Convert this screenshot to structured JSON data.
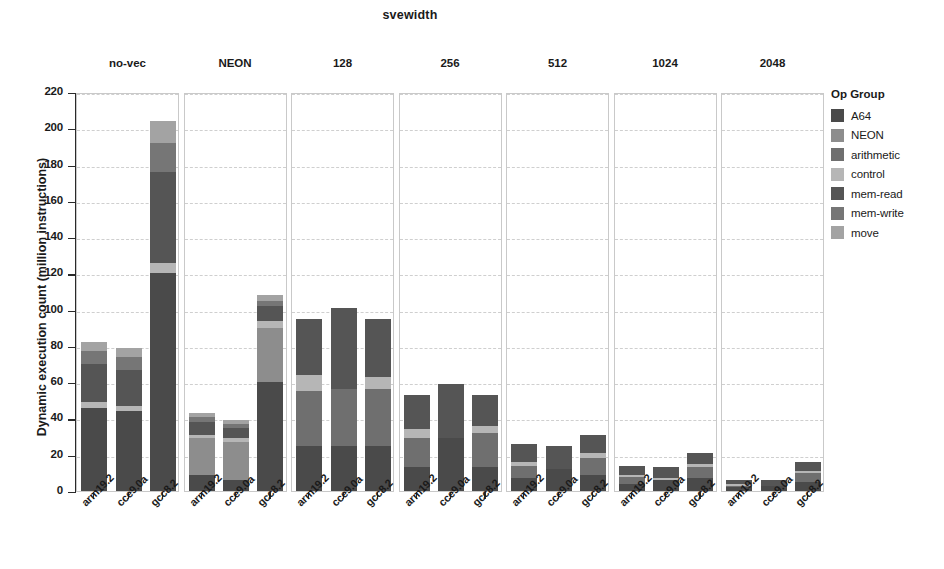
{
  "chart_data": {
    "type": "bar",
    "subtype": "stacked-bar-faceted",
    "title": "svewidth",
    "xlabel": "",
    "ylabel": "Dynamic execution count (million instructions)",
    "ylim": [
      0,
      220
    ],
    "ytick_step": 20,
    "yticks": [
      "220",
      "200",
      "180",
      "160",
      "140",
      "120",
      "100",
      "80",
      "60",
      "40",
      "20",
      "0"
    ],
    "grid": true,
    "legend_position": "right",
    "legend_title": "Op Group",
    "categories": [
      "arm19.2",
      "cce9.0a",
      "gcc8.2"
    ],
    "facets": [
      "no-vec",
      "NEON",
      "128",
      "256",
      "512",
      "1024",
      "2048"
    ],
    "series": [
      {
        "name": "A64",
        "color": "#4a4a4a"
      },
      {
        "name": "NEON",
        "color": "#8d8d8d"
      },
      {
        "name": "arithmetic",
        "color": "#6f6f6f"
      },
      {
        "name": "control",
        "color": "#b6b6b6"
      },
      {
        "name": "mem-read",
        "color": "#555555"
      },
      {
        "name": "mem-write",
        "color": "#767676"
      },
      {
        "name": "move",
        "color": "#a3a3a3"
      }
    ],
    "panels": [
      {
        "facet": "no-vec",
        "bars": [
          {
            "category": "arm19.2",
            "total": 82,
            "segments": [
              {
                "name": "A64",
                "value": 46
              },
              {
                "name": "NEON",
                "value": 0
              },
              {
                "name": "arithmetic",
                "value": 0
              },
              {
                "name": "control",
                "value": 3
              },
              {
                "name": "mem-read",
                "value": 21
              },
              {
                "name": "mem-write",
                "value": 7
              },
              {
                "name": "move",
                "value": 5
              }
            ]
          },
          {
            "category": "cce9.0a",
            "total": 79,
            "segments": [
              {
                "name": "A64",
                "value": 44
              },
              {
                "name": "NEON",
                "value": 0
              },
              {
                "name": "arithmetic",
                "value": 0
              },
              {
                "name": "control",
                "value": 3
              },
              {
                "name": "mem-read",
                "value": 20
              },
              {
                "name": "mem-write",
                "value": 7
              },
              {
                "name": "move",
                "value": 5
              }
            ]
          },
          {
            "category": "gcc8.2",
            "total": 204,
            "segments": [
              {
                "name": "A64",
                "value": 120
              },
              {
                "name": "NEON",
                "value": 0
              },
              {
                "name": "arithmetic",
                "value": 0
              },
              {
                "name": "control",
                "value": 6
              },
              {
                "name": "mem-read",
                "value": 50
              },
              {
                "name": "mem-write",
                "value": 16
              },
              {
                "name": "move",
                "value": 12
              }
            ]
          }
        ]
      },
      {
        "facet": "NEON",
        "bars": [
          {
            "category": "arm19.2",
            "total": 43,
            "segments": [
              {
                "name": "A64",
                "value": 9
              },
              {
                "name": "NEON",
                "value": 20
              },
              {
                "name": "arithmetic",
                "value": 0
              },
              {
                "name": "control",
                "value": 2
              },
              {
                "name": "mem-read",
                "value": 7
              },
              {
                "name": "mem-write",
                "value": 3
              },
              {
                "name": "move",
                "value": 2
              }
            ]
          },
          {
            "category": "cce9.0a",
            "total": 39,
            "segments": [
              {
                "name": "A64",
                "value": 6
              },
              {
                "name": "NEON",
                "value": 21
              },
              {
                "name": "arithmetic",
                "value": 0
              },
              {
                "name": "control",
                "value": 2
              },
              {
                "name": "mem-read",
                "value": 6
              },
              {
                "name": "mem-write",
                "value": 2
              },
              {
                "name": "move",
                "value": 2
              }
            ]
          },
          {
            "category": "gcc8.2",
            "total": 108,
            "segments": [
              {
                "name": "A64",
                "value": 60
              },
              {
                "name": "NEON",
                "value": 30
              },
              {
                "name": "arithmetic",
                "value": 0
              },
              {
                "name": "control",
                "value": 4
              },
              {
                "name": "mem-read",
                "value": 8
              },
              {
                "name": "mem-write",
                "value": 3
              },
              {
                "name": "move",
                "value": 3
              }
            ]
          }
        ]
      },
      {
        "facet": "128",
        "bars": [
          {
            "category": "arm19.2",
            "total": 95,
            "segments": [
              {
                "name": "A64",
                "value": 25
              },
              {
                "name": "NEON",
                "value": 0
              },
              {
                "name": "arithmetic",
                "value": 30
              },
              {
                "name": "control",
                "value": 9
              },
              {
                "name": "mem-read",
                "value": 31
              },
              {
                "name": "mem-write",
                "value": 0
              },
              {
                "name": "move",
                "value": 0
              }
            ]
          },
          {
            "category": "cce9.0a",
            "total": 101,
            "segments": [
              {
                "name": "A64",
                "value": 25
              },
              {
                "name": "NEON",
                "value": 0
              },
              {
                "name": "arithmetic",
                "value": 31
              },
              {
                "name": "control",
                "value": 0
              },
              {
                "name": "mem-read",
                "value": 45
              },
              {
                "name": "mem-write",
                "value": 0
              },
              {
                "name": "move",
                "value": 0
              }
            ]
          },
          {
            "category": "gcc8.2",
            "total": 95,
            "segments": [
              {
                "name": "A64",
                "value": 25
              },
              {
                "name": "NEON",
                "value": 0
              },
              {
                "name": "arithmetic",
                "value": 31
              },
              {
                "name": "control",
                "value": 7
              },
              {
                "name": "mem-read",
                "value": 32
              },
              {
                "name": "mem-write",
                "value": 0
              },
              {
                "name": "move",
                "value": 0
              }
            ]
          }
        ]
      },
      {
        "facet": "256",
        "bars": [
          {
            "category": "arm19.2",
            "total": 53,
            "segments": [
              {
                "name": "A64",
                "value": 13
              },
              {
                "name": "NEON",
                "value": 0
              },
              {
                "name": "arithmetic",
                "value": 16
              },
              {
                "name": "control",
                "value": 5
              },
              {
                "name": "mem-read",
                "value": 19
              },
              {
                "name": "mem-write",
                "value": 0
              },
              {
                "name": "move",
                "value": 0
              }
            ]
          },
          {
            "category": "cce9.0a",
            "total": 59,
            "segments": [
              {
                "name": "A64",
                "value": 29
              },
              {
                "name": "NEON",
                "value": 0
              },
              {
                "name": "arithmetic",
                "value": 0
              },
              {
                "name": "control",
                "value": 0
              },
              {
                "name": "mem-read",
                "value": 30
              },
              {
                "name": "mem-write",
                "value": 0
              },
              {
                "name": "move",
                "value": 0
              }
            ]
          },
          {
            "category": "gcc8.2",
            "total": 53,
            "segments": [
              {
                "name": "A64",
                "value": 13
              },
              {
                "name": "NEON",
                "value": 0
              },
              {
                "name": "arithmetic",
                "value": 19
              },
              {
                "name": "control",
                "value": 4
              },
              {
                "name": "mem-read",
                "value": 17
              },
              {
                "name": "mem-write",
                "value": 0
              },
              {
                "name": "move",
                "value": 0
              }
            ]
          }
        ]
      },
      {
        "facet": "512",
        "bars": [
          {
            "category": "arm19.2",
            "total": 26,
            "segments": [
              {
                "name": "A64",
                "value": 7
              },
              {
                "name": "NEON",
                "value": 0
              },
              {
                "name": "arithmetic",
                "value": 7
              },
              {
                "name": "control",
                "value": 2
              },
              {
                "name": "mem-read",
                "value": 10
              },
              {
                "name": "mem-write",
                "value": 0
              },
              {
                "name": "move",
                "value": 0
              }
            ]
          },
          {
            "category": "cce9.0a",
            "total": 25,
            "segments": [
              {
                "name": "A64",
                "value": 12
              },
              {
                "name": "NEON",
                "value": 0
              },
              {
                "name": "arithmetic",
                "value": 0
              },
              {
                "name": "control",
                "value": 0
              },
              {
                "name": "mem-read",
                "value": 13
              },
              {
                "name": "mem-write",
                "value": 0
              },
              {
                "name": "move",
                "value": 0
              }
            ]
          },
          {
            "category": "gcc8.2",
            "total": 31,
            "segments": [
              {
                "name": "A64",
                "value": 9
              },
              {
                "name": "NEON",
                "value": 0
              },
              {
                "name": "arithmetic",
                "value": 9
              },
              {
                "name": "control",
                "value": 3
              },
              {
                "name": "mem-read",
                "value": 10
              },
              {
                "name": "mem-write",
                "value": 0
              },
              {
                "name": "move",
                "value": 0
              }
            ]
          }
        ]
      },
      {
        "facet": "1024",
        "bars": [
          {
            "category": "arm19.2",
            "total": 14,
            "segments": [
              {
                "name": "A64",
                "value": 4
              },
              {
                "name": "NEON",
                "value": 0
              },
              {
                "name": "arithmetic",
                "value": 4
              },
              {
                "name": "control",
                "value": 1
              },
              {
                "name": "mem-read",
                "value": 5
              },
              {
                "name": "mem-write",
                "value": 0
              },
              {
                "name": "move",
                "value": 0
              }
            ]
          },
          {
            "category": "cce9.0a",
            "total": 13,
            "segments": [
              {
                "name": "A64",
                "value": 6
              },
              {
                "name": "NEON",
                "value": 0
              },
              {
                "name": "arithmetic",
                "value": 0
              },
              {
                "name": "control",
                "value": 1
              },
              {
                "name": "mem-read",
                "value": 6
              },
              {
                "name": "mem-write",
                "value": 0
              },
              {
                "name": "move",
                "value": 0
              }
            ]
          },
          {
            "category": "gcc8.2",
            "total": 21,
            "segments": [
              {
                "name": "A64",
                "value": 7
              },
              {
                "name": "NEON",
                "value": 0
              },
              {
                "name": "arithmetic",
                "value": 6
              },
              {
                "name": "control",
                "value": 2
              },
              {
                "name": "mem-read",
                "value": 6
              },
              {
                "name": "mem-write",
                "value": 0
              },
              {
                "name": "move",
                "value": 0
              }
            ]
          }
        ]
      },
      {
        "facet": "2048",
        "bars": [
          {
            "category": "arm19.2",
            "total": 6,
            "segments": [
              {
                "name": "A64",
                "value": 2
              },
              {
                "name": "NEON",
                "value": 0
              },
              {
                "name": "arithmetic",
                "value": 1
              },
              {
                "name": "control",
                "value": 1
              },
              {
                "name": "mem-read",
                "value": 2
              },
              {
                "name": "mem-write",
                "value": 0
              },
              {
                "name": "move",
                "value": 0
              }
            ]
          },
          {
            "category": "cce9.0a",
            "total": 6,
            "segments": [
              {
                "name": "A64",
                "value": 3
              },
              {
                "name": "NEON",
                "value": 0
              },
              {
                "name": "arithmetic",
                "value": 0
              },
              {
                "name": "control",
                "value": 0
              },
              {
                "name": "mem-read",
                "value": 3
              },
              {
                "name": "mem-write",
                "value": 0
              },
              {
                "name": "move",
                "value": 0
              }
            ]
          },
          {
            "category": "gcc8.2",
            "total": 16,
            "segments": [
              {
                "name": "A64",
                "value": 5
              },
              {
                "name": "NEON",
                "value": 0
              },
              {
                "name": "arithmetic",
                "value": 5
              },
              {
                "name": "control",
                "value": 1
              },
              {
                "name": "mem-read",
                "value": 5
              },
              {
                "name": "mem-write",
                "value": 0
              },
              {
                "name": "move",
                "value": 0
              }
            ]
          }
        ]
      }
    ]
  }
}
